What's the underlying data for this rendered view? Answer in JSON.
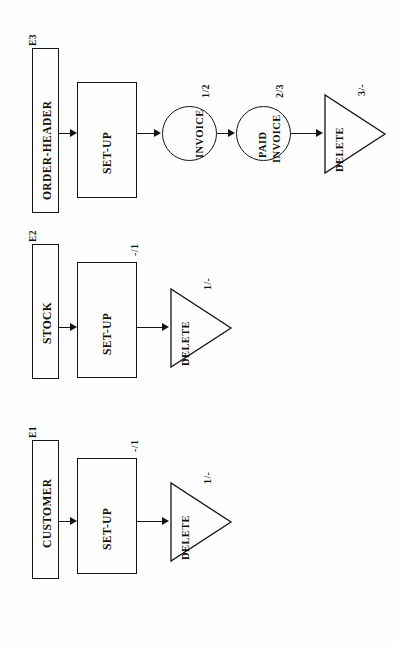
{
  "diagram": {
    "orientation": "rotated-90",
    "lanes": [
      {
        "id": "E3",
        "lane_label": "E3",
        "entity": "ORDER-HEADER",
        "process": "SET-UP",
        "process_state": "",
        "nodes": [
          {
            "label": "INVOICE",
            "line2": "",
            "state": "1/2"
          },
          {
            "label": "PAID",
            "line2": "INVOICE",
            "state": "2/3"
          }
        ],
        "terminal": {
          "label": "DELETE",
          "state": "3/-"
        }
      },
      {
        "id": "E2",
        "lane_label": "E2",
        "entity": "STOCK",
        "process": "SET-UP",
        "process_state": "-/1",
        "nodes": [],
        "terminal": {
          "label": "DELETE",
          "state": "1/-"
        }
      },
      {
        "id": "E1",
        "lane_label": "E1",
        "entity": "CUSTOMER",
        "process": "SET-UP",
        "process_state": "-/1",
        "nodes": [],
        "terminal": {
          "label": "DELETE",
          "state": "1/-"
        }
      }
    ],
    "colors": {
      "line": "#141414",
      "background": "#fefefe",
      "text": "#111111"
    }
  }
}
